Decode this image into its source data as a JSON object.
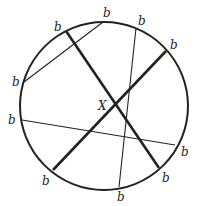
{
  "diagram": {
    "type": "circle-chords",
    "circle": {
      "cx": 104,
      "cy": 106,
      "r": 84,
      "stroke": "#222222",
      "stroke_width": 2
    },
    "thick_chords": [
      {
        "id": "thick-chord-1",
        "x1": 66,
        "y1": 31,
        "x2": 159,
        "y2": 168
      },
      {
        "id": "thick-chord-2",
        "x1": 166,
        "y1": 51,
        "x2": 53,
        "y2": 170
      }
    ],
    "thin_chords": [
      {
        "id": "thin-chord-a",
        "x1": 103,
        "y1": 22,
        "x2": 24,
        "y2": 82
      },
      {
        "id": "thin-chord-b",
        "x1": 136,
        "y1": 28,
        "x2": 119,
        "y2": 187
      },
      {
        "id": "thin-chord-c",
        "x1": 22,
        "y1": 120,
        "x2": 175,
        "y2": 145
      }
    ],
    "intersection_label": {
      "text": "X",
      "x": 98,
      "y": 110
    },
    "endpoint_labels": [
      {
        "text": "b",
        "x": 54,
        "y": 31
      },
      {
        "text": "b",
        "x": 103,
        "y": 17
      },
      {
        "text": "b",
        "x": 138,
        "y": 25
      },
      {
        "text": "b",
        "x": 170,
        "y": 49
      },
      {
        "text": "b",
        "x": 12,
        "y": 86
      },
      {
        "text": "b",
        "x": 8,
        "y": 124
      },
      {
        "text": "b",
        "x": 181,
        "y": 156
      },
      {
        "text": "b",
        "x": 42,
        "y": 185
      },
      {
        "text": "b",
        "x": 162,
        "y": 182
      },
      {
        "text": "b",
        "x": 117,
        "y": 201
      }
    ]
  }
}
